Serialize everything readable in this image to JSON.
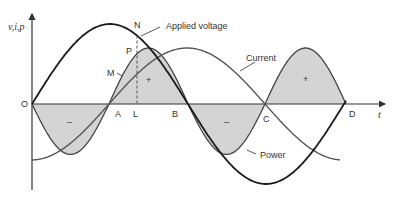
{
  "diagram": {
    "type": "ac-waveforms-power",
    "axis": {
      "y_label": "v,i,p",
      "x_label": "t",
      "origin_label": "O"
    },
    "points": {
      "A": "A",
      "L": "L",
      "B": "B",
      "C": "C",
      "D": "D",
      "N": "N",
      "P": "P",
      "M": "M"
    },
    "curve_labels": {
      "voltage": "Applied voltage",
      "current": "Current",
      "power": "Power"
    },
    "sign_labels": {
      "neg1": "–",
      "pos1": "+",
      "neg2": "–",
      "pos2": "+"
    },
    "colors": {
      "voltage": "#1a1a1a",
      "current": "#555555",
      "power": "#444444",
      "shade": "#d4d4d4",
      "axis": "#333333"
    },
    "geometry": {
      "x_origin": 32,
      "y_axis_zero": 104,
      "x_A": 109,
      "x_L": 137,
      "x_B": 188,
      "x_C": 265,
      "x_D": 346,
      "voltage_amplitude": 80,
      "current_amplitude": 56,
      "power_scale": 56
    }
  }
}
